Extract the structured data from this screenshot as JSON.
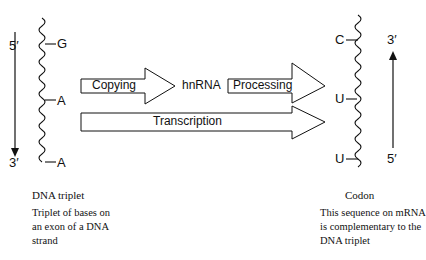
{
  "header_fragment": "nana",
  "dna_strand": {
    "top_end": "5′",
    "bottom_end": "3′",
    "bases": [
      "G",
      "A",
      "A"
    ],
    "title": "DNA triplet",
    "description_lines": [
      "Triplet of bases on",
      "an exon of a DNA",
      "strand"
    ]
  },
  "process": {
    "copying_label": "Copying",
    "intermediate_label": "hnRNA",
    "processing_label": "Processing",
    "transcription_label": "Transcription"
  },
  "mrna_strand": {
    "top_end": "3′",
    "bottom_end": "5′",
    "bases": [
      "C",
      "U",
      "U"
    ],
    "title": "Codon",
    "description_lines": [
      "This sequence on mRNA",
      "is complementary to the",
      "DNA triplet"
    ]
  }
}
